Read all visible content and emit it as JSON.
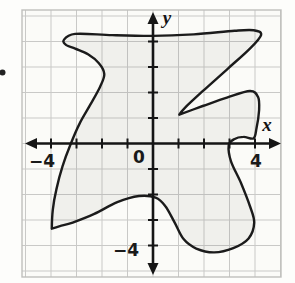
{
  "figure": {
    "stray_mark": "cropped-list-marker-dot"
  },
  "chart_data": {
    "type": "area",
    "title": "",
    "xlabel": "x",
    "ylabel": "y",
    "axes": {
      "x_label": "x",
      "y_label": "y",
      "origin_label": "0",
      "x_neg_label": "−4",
      "x_pos_label": "4",
      "y_neg_label": "−4",
      "x_range": [
        -5,
        5
      ],
      "y_range": [
        -5,
        5
      ],
      "tick_step": 1,
      "grid": true,
      "labeled_ticks": {
        "x": [
          -4,
          4
        ],
        "y": [
          -4
        ]
      }
    },
    "colors": {
      "curve": "#1b1b1b",
      "axis": "#151515",
      "grid_line": "#c9c9c7",
      "grid_border": "#bfbfbd",
      "grid_fill": "#fbfbf8",
      "region_fill": "rgba(95,95,85,0.07)",
      "text": "#1a1a1a"
    },
    "curve_points": [
      [
        -3.5,
        4.06
      ],
      [
        -3.05,
        4.3
      ],
      [
        -1.6,
        4.25
      ],
      [
        0.0,
        4.22
      ],
      [
        1.6,
        4.28
      ],
      [
        3.2,
        4.42
      ],
      [
        3.95,
        4.44
      ],
      [
        4.24,
        4.26
      ],
      [
        3.8,
        3.72
      ],
      [
        2.95,
        2.95
      ],
      [
        1.95,
        2.05
      ],
      [
        1.25,
        1.4
      ],
      [
        1.03,
        1.13,
        1
      ],
      [
        1.95,
        1.47
      ],
      [
        2.9,
        1.8
      ],
      [
        3.8,
        2.06
      ],
      [
        4.12,
        1.82
      ],
      [
        4.16,
        1.3
      ],
      [
        4.06,
        0.6
      ],
      [
        3.94,
        0.2
      ],
      [
        3.55,
        0.26
      ],
      [
        3.18,
        0.17
      ],
      [
        2.97,
        -0.08
      ],
      [
        3.06,
        -0.7
      ],
      [
        3.45,
        -1.55
      ],
      [
        3.8,
        -2.45
      ],
      [
        3.97,
        -3.1
      ],
      [
        3.75,
        -3.72
      ],
      [
        3.15,
        -4.1
      ],
      [
        2.4,
        -4.27
      ],
      [
        1.7,
        -4.12
      ],
      [
        1.2,
        -3.75
      ],
      [
        0.85,
        -3.1
      ],
      [
        0.48,
        -2.45
      ],
      [
        0.1,
        -2.12
      ],
      [
        -0.55,
        -2.06
      ],
      [
        -1.4,
        -2.3
      ],
      [
        -2.3,
        -2.76
      ],
      [
        -3.15,
        -3.1
      ],
      [
        -3.65,
        -3.24
      ],
      [
        -3.97,
        -3.34,
        1
      ],
      [
        -3.93,
        -2.6
      ],
      [
        -3.79,
        -1.8
      ],
      [
        -3.55,
        -0.9
      ],
      [
        -3.24,
        -0.05
      ],
      [
        -2.88,
        0.78
      ],
      [
        -2.46,
        1.52
      ],
      [
        -2.08,
        2.22
      ],
      [
        -1.91,
        2.72
      ],
      [
        -2.12,
        3.15
      ],
      [
        -2.55,
        3.5
      ],
      [
        -3.05,
        3.72
      ],
      [
        -3.4,
        3.86
      ]
    ]
  },
  "layout": {
    "origin_px": [
      153,
      143.5
    ],
    "unit_px": 25.5,
    "grid_rect": [
      22,
      10,
      259,
      267
    ],
    "x_axis_px": [
      25,
      281
    ],
    "y_axis_px": [
      12,
      275
    ]
  }
}
